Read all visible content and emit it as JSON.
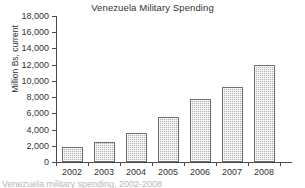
{
  "chart_data": {
    "type": "bar",
    "title": "Venezuela Military Spending",
    "xlabel": "",
    "ylabel": "Million Bs, current",
    "categories": [
      "2002",
      "2003",
      "2004",
      "2005",
      "2006",
      "2007",
      "2008"
    ],
    "values": [
      1875,
      2500,
      3600,
      5500,
      7800,
      9300,
      11900
    ],
    "series": [
      {
        "name": "Military Spending",
        "values": [
          1875,
          2500,
          3600,
          5500,
          7800,
          9300,
          11900
        ]
      }
    ],
    "ylim": [
      0,
      18000
    ],
    "ytick_interval": 2000,
    "ytick_labels": [
      "18,000",
      "16,000",
      "14,000",
      "12,000",
      "10,000",
      "8,000",
      "6,000",
      "4,000",
      "2,000",
      "0"
    ],
    "ytick_values": [
      18000,
      16000,
      14000,
      12000,
      10000,
      8000,
      6000,
      4000,
      2000,
      0
    ],
    "grid": false,
    "legend": false,
    "legend_position": "none",
    "bar_color": "#b4b4b4",
    "bar_edge_color": "#6f6f6f",
    "axis_color": "#4a4a4a",
    "background_color": "#ffffff",
    "text_color": "#333333"
  },
  "caption": {
    "text": "Venezuela military spending, 2002-2008"
  }
}
